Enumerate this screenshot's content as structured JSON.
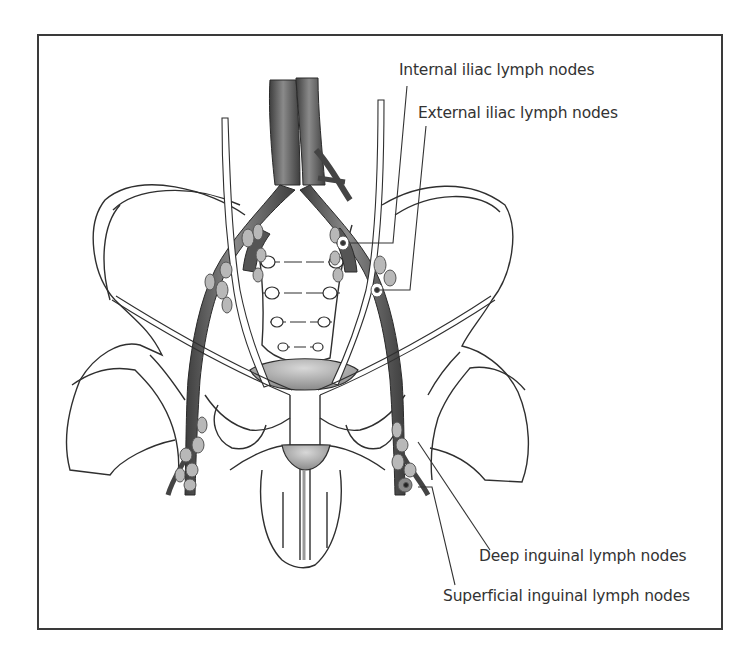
{
  "figure": {
    "labels": {
      "internal_iliac": "Internal iliac lymph nodes",
      "external_iliac": "External iliac lymph nodes",
      "deep_inguinal": "Deep inguinal lymph nodes",
      "superficial_inguinal": "Superficial inguinal lymph nodes"
    },
    "colors": {
      "frame": "#3a3a3a",
      "line": "#2f2f2f",
      "vessel": "#555555",
      "vessel_highlight": "#8a8a8a",
      "node": "#b8b8b8",
      "text": "#333333"
    }
  }
}
